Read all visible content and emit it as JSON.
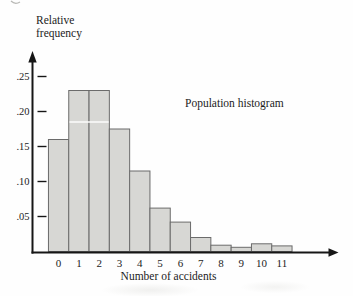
{
  "figure": {
    "background": "#fefefe"
  },
  "chart_data": {
    "type": "bar",
    "title": "",
    "annotation": "Population histogram",
    "ylabel": "Relative\nfrequency",
    "xlabel": "Number of accidents",
    "categories": [
      "0",
      "1",
      "2",
      "3",
      "4",
      "5",
      "6",
      "7",
      "8",
      "9",
      "10",
      "11"
    ],
    "values": [
      0.16,
      0.23,
      0.23,
      0.175,
      0.115,
      0.062,
      0.042,
      0.02,
      0.009,
      0.006,
      0.011,
      0.008
    ],
    "yticks": [
      {
        "value": 0.05,
        "label": ".05"
      },
      {
        "value": 0.1,
        "label": ".10"
      },
      {
        "value": 0.15,
        "label": ".15"
      },
      {
        "value": 0.2,
        "label": ".20"
      },
      {
        "value": 0.25,
        "label": ".25"
      }
    ],
    "ylim": [
      0,
      0.285
    ],
    "grid": false,
    "legend": "none",
    "bar_unit_width": 1,
    "colors": {
      "bar_fill": "#d7d7d4",
      "bar_border": "#6b6b6b",
      "axis": "#161616",
      "text": "#1c1c1c",
      "artifact_line": "#ffffff"
    },
    "print_artifact": {
      "white_line_value": 0.185,
      "across_bars": [
        1,
        2
      ]
    }
  }
}
